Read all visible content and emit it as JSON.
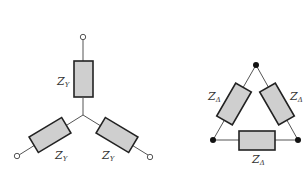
{
  "diagram": {
    "star": {
      "title": "Wye (Y) connection",
      "labels": {
        "top": {
          "main": "Z",
          "sub": "Y"
        },
        "bottom_left": {
          "main": "Z",
          "sub": "Y"
        },
        "bottom_right": {
          "main": "Z",
          "sub": "Y"
        }
      }
    },
    "delta": {
      "title": "Delta (Δ) connection",
      "labels": {
        "left": {
          "main": "Z",
          "sub": "Δ"
        },
        "right": {
          "main": "Z",
          "sub": "Δ"
        },
        "bottom": {
          "main": "Z",
          "sub": "Δ"
        }
      }
    },
    "colors": {
      "resistor_fill": "#cfcfcf",
      "resistor_stroke": "#222222",
      "wire": "#555555",
      "node": "#111111"
    }
  }
}
